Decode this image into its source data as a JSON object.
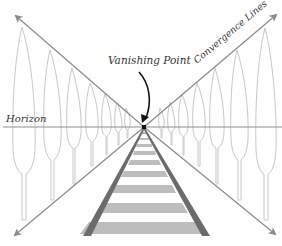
{
  "diagram": {
    "labels": {
      "vanishing_point": "Vanishing Point",
      "convergence_lines": "Convergence Lines",
      "horizon": "Horizon"
    },
    "colors": {
      "background": "#ffffff",
      "convergence_line": "#8a8a8a",
      "horizon_line": "#8f8f8f",
      "tree_outline": "#c8c8c8",
      "rail": "#6b6b6b",
      "tie": "#bdbdbd",
      "vanishing_point": "#111111",
      "pointer_arrow": "#111111",
      "text": "#333333"
    },
    "vanishing_point": {
      "x": 144,
      "y": 127
    },
    "horizon_y": 127
  }
}
